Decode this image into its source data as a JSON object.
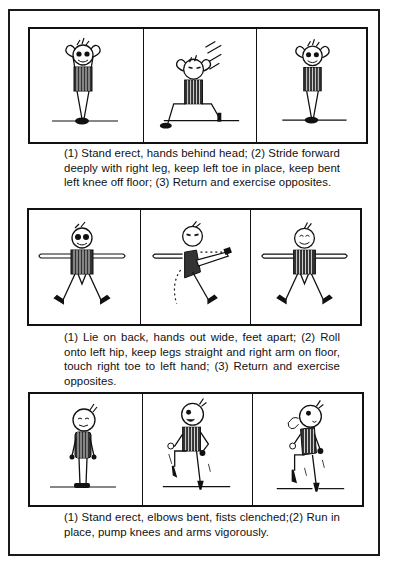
{
  "exercises": [
    {
      "panels": [
        {
          "figure": "standing-hands-behind-head"
        },
        {
          "figure": "forward-lunge-hands-behind-head"
        },
        {
          "figure": "standing-hands-behind-head"
        }
      ],
      "caption": "(1) Stand erect, hands behind head; (2) Stride forward deeply with right leg, keep left toe in place, keep bent left knee off floor; (3) Return and exercise opposites."
    },
    {
      "panels": [
        {
          "figure": "lying-arms-out-feet-apart"
        },
        {
          "figure": "hip-roll-toe-to-hand"
        },
        {
          "figure": "lying-arms-out-feet-apart"
        }
      ],
      "caption": "(1) Lie on back, hands out wide, feet apart; (2) Roll onto left hip, keep legs straight and right arm on floor, touch right toe to left hand; (3) Return and exercise opposites."
    },
    {
      "panels": [
        {
          "figure": "standing-elbows-bent"
        },
        {
          "figure": "running-in-place-left-knee-up"
        },
        {
          "figure": "running-in-place-puffing"
        }
      ],
      "caption": "(1) Stand erect, elbows bent, fists clenched;(2) Run in place, pump knees and arms vigorously."
    }
  ],
  "colors": {
    "ink": "#111111",
    "paper": "#ffffff"
  }
}
